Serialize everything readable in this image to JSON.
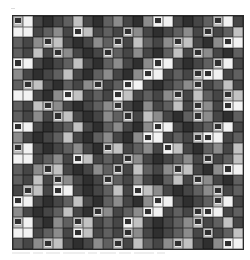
{
  "grid": {
    "columns": 23,
    "rows_count": 22,
    "legend": {
      "W": "white",
      "L": "light gray",
      "G": "mid gray",
      "M": "medium-dark gray",
      "D": "dark gray",
      "K": "very dark gray",
      "F": "light frame with dark center",
      "H": "white frame with dark center"
    },
    "colors": {
      "W": "#f2f2f2",
      "L": "#c2c2c2",
      "G": "#8c8c8c",
      "M": "#606060",
      "D": "#464646",
      "K": "#2f2f2f",
      "F": "#bdbdbd",
      "H": "#f4f4f4"
    },
    "rows": [
      "FWDKDMLDKMGDKGHWDKDMFWD",
      "WWDMGDHLDMDFGDKDMGDFDML",
      "MDGFLDKDGMFDLMDGFLDKGHW",
      "MDLDFGDKDFMDGDKMLDFGDKM",
      "HWDKDMLDKMGDKGHWDKDMFWD",
      "GDKDMLDKMGDKGHWDMDFHWDM",
      "MFLDKMDGFDMHWDKDMGFDMLD",
      "WWDKGHLDMDHLDMDGFDLMDFL",
      "MDLFGDKDMGFDKGDMLDFGDHW",
      "MDGDFLDKDGMFDLGDKMFGDKM",
      "HWDKDMLDKMGDKGHWDKDMFWD",
      "GDKDMLDKMGDKGHWDMDFHWDM",
      "FWDKDMGDKFLDMGDHLDKMGDL",
      "WWDMGDHLDMDFGDKDMGDFDML",
      "MDGFLDKDGMFDLMDGFLDKGHW",
      "MDLDFGDKDFMDGDKMLDFGDKM",
      "DFLDHWDKDMLDHLGDKDMGFDM",
      "HWDKDMLDKMGDKGHWDKDMFWD",
      "GDKDMLDKFGDMGHWDMDFHWDM",
      "FWDKGMFLDMDHLDKDMGFDMLD",
      "WWDMGDHLDMDFGDKDMGDFDML",
      "MDGFLDKDGMFDLMDGFLDKGHW"
    ]
  },
  "caption": {
    "legible": false,
    "fragments": [
      18,
      10,
      14,
      22,
      9,
      16,
      12,
      20,
      8
    ]
  }
}
